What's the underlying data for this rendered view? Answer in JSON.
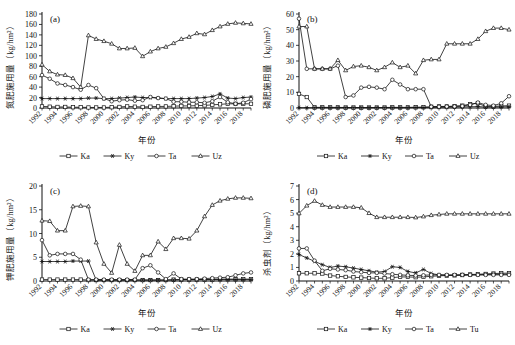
{
  "figure": {
    "xlabel": "年份",
    "units": "（kg/hm²）",
    "panels": [
      "(a)",
      "(b)",
      "(c)",
      "(d)"
    ]
  },
  "chart_data": [
    {
      "type": "line",
      "panel": "(a)",
      "title": "",
      "xlabel": "年份",
      "ylabel": "氮肥施用量（kg/hm²）",
      "ylim": [
        0,
        180
      ],
      "yticks": [
        0,
        20,
        40,
        60,
        80,
        100,
        120,
        140,
        160,
        180
      ],
      "grid": false,
      "legend_position": "bottom",
      "x": [
        1992,
        1993,
        1994,
        1995,
        1996,
        1997,
        1998,
        1999,
        2000,
        2001,
        2002,
        2003,
        2004,
        2005,
        2006,
        2007,
        2008,
        2009,
        2010,
        2011,
        2012,
        2013,
        2014,
        2015,
        2016,
        2017,
        2018,
        2019
      ],
      "xticklabels": [
        "1992",
        "1994",
        "1996",
        "1998",
        "2000",
        "2002",
        "2004",
        "2006",
        "2008",
        "2010",
        "2012",
        "2014",
        "2016",
        "2018"
      ],
      "series": [
        {
          "name": "Ka",
          "marker": "square",
          "values": [
            3,
            2.5,
            2,
            2,
            1.5,
            1.5,
            1,
            1,
            1,
            1.5,
            2,
            3,
            2.5,
            2,
            2.5,
            3,
            3,
            3.5,
            4,
            4,
            4.5,
            5,
            6,
            7,
            8,
            8,
            8,
            8
          ]
        },
        {
          "name": "Ky",
          "marker": "star",
          "values": [
            18,
            18,
            18,
            18,
            18,
            18,
            19,
            19,
            18,
            18,
            19,
            20,
            21,
            20,
            20,
            19,
            18,
            18,
            18,
            18,
            19,
            20,
            22,
            27,
            19,
            18,
            20,
            21
          ]
        },
        {
          "name": "Ta",
          "marker": "circle",
          "values": [
            63,
            56,
            47,
            44,
            40,
            35,
            44,
            38,
            18,
            13,
            15,
            16,
            14,
            15,
            21,
            19,
            18,
            12,
            12,
            11,
            11,
            10,
            13,
            21,
            11,
            8,
            10,
            17
          ]
        },
        {
          "name": "Uz",
          "marker": "triangle",
          "values": [
            83,
            70,
            64,
            63,
            57,
            40,
            139,
            132,
            128,
            123,
            114,
            114,
            115,
            99,
            108,
            114,
            117,
            124,
            132,
            136,
            143,
            141,
            149,
            156,
            161,
            163,
            162,
            161
          ]
        }
      ]
    },
    {
      "type": "line",
      "panel": "(b)",
      "title": "",
      "xlabel": "年份",
      "ylabel": "磷肥施用量（kg/hm²）",
      "ylim": [
        0,
        60
      ],
      "yticks": [
        0,
        10,
        20,
        30,
        40,
        50,
        60
      ],
      "grid": false,
      "legend_position": "bottom",
      "x": [
        1992,
        1993,
        1994,
        1995,
        1996,
        1997,
        1998,
        1999,
        2000,
        2001,
        2002,
        2003,
        2004,
        2005,
        2006,
        2007,
        2008,
        2009,
        2010,
        2011,
        2012,
        2013,
        2014,
        2015,
        2016,
        2017,
        2018,
        2019
      ],
      "xticklabels": [
        "1992",
        "1994",
        "1996",
        "1998",
        "2000",
        "2002",
        "2004",
        "2006",
        "2008",
        "2010",
        "2012",
        "2014",
        "2016",
        "2018"
      ],
      "series": [
        {
          "name": "Ka",
          "marker": "square",
          "values": [
            9,
            7,
            0.4,
            0.4,
            0.4,
            0.4,
            0.3,
            0.3,
            0.3,
            0.3,
            0.3,
            0.3,
            0.4,
            0.4,
            0.4,
            0.5,
            0.6,
            0.8,
            1,
            1,
            1.2,
            1.5,
            2.5,
            3,
            1,
            1,
            1.3,
            1.5
          ]
        },
        {
          "name": "Ky",
          "marker": "star",
          "values": [
            0.2,
            0.2,
            0.2,
            0.2,
            0.2,
            0.2,
            0.2,
            0.2,
            0.2,
            0.2,
            0.2,
            0.2,
            0.2,
            0.2,
            0.2,
            0.3,
            0.3,
            0.4,
            0.5,
            0.5,
            0.6,
            0.7,
            0.8,
            0.9,
            0.6,
            0.6,
            0.7,
            0.8
          ]
        },
        {
          "name": "Ta",
          "marker": "circle",
          "values": [
            57,
            25,
            25,
            25,
            25,
            27,
            7,
            8,
            13,
            13.5,
            13,
            12,
            18,
            15,
            12,
            12,
            12,
            0.8,
            0.8,
            0.9,
            1,
            1.2,
            2,
            3.5,
            2,
            1.5,
            3,
            7.5
          ]
        },
        {
          "name": "Uz",
          "marker": "triangle",
          "values": [
            52,
            52,
            25,
            25,
            25,
            30.5,
            24,
            26.5,
            27,
            26,
            24,
            26,
            29,
            26,
            27,
            22,
            30.5,
            31,
            31,
            41,
            41,
            41,
            41,
            44,
            49,
            51,
            51,
            50
          ]
        }
      ]
    },
    {
      "type": "line",
      "panel": "(c)",
      "title": "",
      "xlabel": "年份",
      "ylabel": "钾肥施用量（kg/hm²）",
      "ylim": [
        0,
        20
      ],
      "yticks": [
        0,
        5,
        10,
        15,
        20
      ],
      "grid": false,
      "legend_position": "bottom",
      "x": [
        1992,
        1993,
        1994,
        1995,
        1996,
        1997,
        1998,
        1999,
        2000,
        2001,
        2002,
        2003,
        2004,
        2005,
        2006,
        2007,
        2008,
        2009,
        2010,
        2011,
        2012,
        2013,
        2014,
        2015,
        2016,
        2017,
        2018,
        2019
      ],
      "xticklabels": [
        "1992",
        "1994",
        "1996",
        "1998",
        "2000",
        "2002",
        "2004",
        "2006",
        "2008",
        "2010",
        "2012",
        "2014",
        "2016",
        "2018"
      ],
      "series": [
        {
          "name": "Ka",
          "marker": "square",
          "values": [
            0.3,
            0.3,
            0.3,
            0.3,
            0.3,
            0.3,
            0.2,
            0.2,
            0.2,
            0.2,
            0.2,
            0.2,
            0.2,
            0.2,
            0.2,
            0.2,
            0.2,
            0.3,
            0.3,
            0.3,
            0.3,
            0.3,
            0.3,
            0.4,
            0.4,
            0.4,
            0.4,
            0.4
          ]
        },
        {
          "name": "Ky",
          "marker": "star",
          "values": [
            4.1,
            4.1,
            4.1,
            4.1,
            4.2,
            4.2,
            4.2,
            0.2,
            0.2,
            0.2,
            0.2,
            0.2,
            0.2,
            0.2,
            0.2,
            0.2,
            0.2,
            0.2,
            0.3,
            0.3,
            0.3,
            0.3,
            0.3,
            0.3,
            0.3,
            0.3,
            0.3,
            0.3
          ]
        },
        {
          "name": "Ta",
          "marker": "circle",
          "values": [
            8.6,
            5.4,
            5.7,
            5.7,
            5.7,
            4.5,
            0.3,
            0.3,
            0.3,
            0.3,
            0.3,
            0.3,
            0.3,
            2.7,
            3.3,
            1.8,
            0.4,
            1.6,
            0.4,
            0.4,
            0.4,
            0.5,
            0.6,
            0.7,
            0.8,
            1.2,
            1.6,
            1.8
          ]
        },
        {
          "name": "Uz",
          "marker": "triangle",
          "values": [
            12.7,
            12.6,
            10.6,
            10.6,
            15.7,
            15.8,
            15.7,
            8.1,
            3.6,
            1.7,
            7.6,
            3.6,
            2.1,
            5.4,
            5.4,
            8.3,
            6.7,
            9,
            9,
            8.9,
            10.6,
            13.6,
            16,
            16.9,
            17.3,
            17.5,
            17.5,
            17.4
          ]
        }
      ]
    },
    {
      "type": "line",
      "panel": "(d)",
      "title": "",
      "xlabel": "年份",
      "ylabel": "杀虫剂（kg/hm²）",
      "ylim": [
        0,
        7
      ],
      "yticks": [
        0,
        1,
        2,
        3,
        4,
        5,
        6,
        7
      ],
      "grid": false,
      "legend_position": "bottom",
      "x": [
        1992,
        1993,
        1994,
        1995,
        1996,
        1997,
        1998,
        1999,
        2000,
        2001,
        2002,
        2003,
        2004,
        2005,
        2006,
        2007,
        2008,
        2009,
        2010,
        2011,
        2012,
        2013,
        2014,
        2015,
        2016,
        2017,
        2018,
        2019
      ],
      "xticklabels": [
        "1992",
        "1994",
        "1996",
        "1998",
        "2000",
        "2002",
        "2004",
        "2006",
        "2008",
        "2010",
        "2012",
        "2014",
        "2016",
        "2018"
      ],
      "series": [
        {
          "name": "Ka",
          "marker": "square",
          "values": [
            0.57,
            0.57,
            0.57,
            0.55,
            0.4,
            0.35,
            0.3,
            0.27,
            0.25,
            0.22,
            0.2,
            0.2,
            0.25,
            0.3,
            0.3,
            0.28,
            0.3,
            0.35,
            0.38,
            0.4,
            0.42,
            0.45,
            0.48,
            0.5,
            0.52,
            0.55,
            0.57,
            0.58
          ]
        },
        {
          "name": "Ky",
          "marker": "star",
          "values": [
            1.95,
            1.7,
            1.45,
            1.2,
            1.0,
            1.1,
            1.05,
            0.95,
            0.85,
            0.75,
            0.65,
            0.7,
            1.05,
            1.0,
            0.7,
            0.6,
            0.85,
            0.55,
            0.45,
            0.42,
            0.42,
            0.42,
            0.45,
            0.45,
            0.48,
            0.5,
            0.5,
            0.5
          ]
        },
        {
          "name": "Ta",
          "marker": "circle",
          "values": [
            2.4,
            2.4,
            1.5,
            0.75,
            0.9,
            0.85,
            0.8,
            0.7,
            0.65,
            0.6,
            0.6,
            0.55,
            0.5,
            0.45,
            0.42,
            0.4,
            0.42,
            0.45,
            0.45,
            0.45,
            0.45,
            0.45,
            0.45,
            0.45,
            0.45,
            0.45,
            0.45,
            0.45
          ]
        },
        {
          "name": "Tu",
          "marker": "triangle",
          "values": [
            4.98,
            5.55,
            5.9,
            5.6,
            5.45,
            5.45,
            5.45,
            5.45,
            5.4,
            5.0,
            4.7,
            4.7,
            4.7,
            4.7,
            4.7,
            4.68,
            4.75,
            4.85,
            4.9,
            4.95,
            4.95,
            4.95,
            4.95,
            4.95,
            4.95,
            4.95,
            4.95,
            4.95
          ]
        }
      ]
    }
  ]
}
